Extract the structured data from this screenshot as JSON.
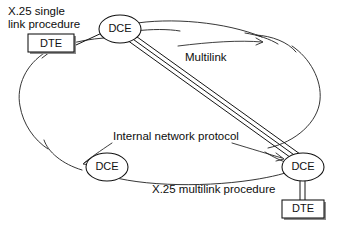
{
  "diagram": {
    "background_color": "#ffffff",
    "line_color": "#111111",
    "text_color": "#0d0d0d",
    "width": 348,
    "height": 228
  },
  "nodes": {
    "dte_top": {
      "label": "DTE",
      "shape": "rectangle",
      "x": 51,
      "y": 44
    },
    "dce_top": {
      "label": "DCE",
      "shape": "ellipse",
      "x": 120,
      "y": 29
    },
    "dce_bottom_left": {
      "label": "DCE",
      "shape": "ellipse",
      "x": 107,
      "y": 167
    },
    "dce_bottom_right": {
      "label": "DCE",
      "shape": "ellipse",
      "x": 303,
      "y": 167
    },
    "dte_bottom": {
      "label": "DTE",
      "shape": "rectangle",
      "x": 303,
      "y": 209
    }
  },
  "labels": {
    "single_link": {
      "line1": "X.25 single",
      "line2": "link procedure",
      "x": 8,
      "y": 10
    },
    "multilink": {
      "text": "Multilink",
      "x": 185,
      "y": 58
    },
    "internal_network_protocol": {
      "text": "Internal network protocol",
      "x": 113,
      "y": 137
    },
    "multilink_procedure": {
      "text": "X.25 multilink procedure",
      "x": 152,
      "y": 190
    }
  },
  "connections": {
    "dte_top_to_dce_top": {
      "type": "single-line",
      "from": "dte_top",
      "to": "dce_top"
    },
    "dce_top_to_dce_bottom_right": {
      "type": "multilink-triple-line",
      "from": "dce_top",
      "to": "dce_bottom_right"
    },
    "dce_bottom_right_to_dte_bottom": {
      "type": "multilink-double-line",
      "from": "dce_bottom_right",
      "to": "dte_bottom"
    }
  },
  "cloud": {
    "name": "network-cloud",
    "description": "Internal network boundary"
  }
}
